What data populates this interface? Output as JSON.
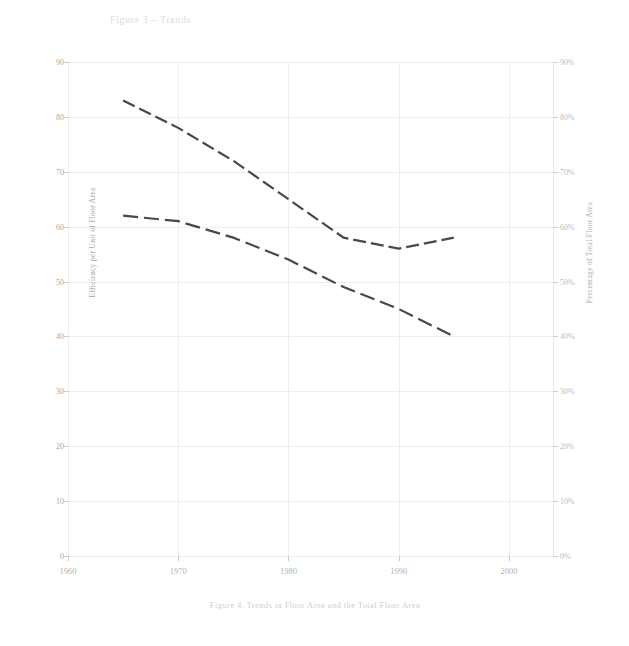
{
  "chart_data": {
    "type": "line",
    "title": "Figure 3 – Trends",
    "xlabel": "",
    "ylabel": "Efficiency per Unit of Floor Area",
    "y2label": "Percentage of Total Floor Area",
    "xlim": [
      1960,
      2004
    ],
    "ylim": [
      0,
      90
    ],
    "y2lim": [
      0,
      90
    ],
    "grid": true,
    "legend": "none",
    "xticks": [
      "1960",
      "1970",
      "1980",
      "1990",
      "2000"
    ],
    "xtick_values": [
      1960,
      1970,
      1980,
      1990,
      2000
    ],
    "yticks": [
      "90",
      "80",
      "70",
      "60",
      "50",
      "40",
      "30",
      "20",
      "10",
      "0"
    ],
    "ytick_values": [
      90,
      80,
      70,
      60,
      50,
      40,
      30,
      20,
      10,
      0
    ],
    "y2ticks": [
      "90%",
      "80%",
      "70%",
      "60%",
      "50%",
      "40%",
      "30%",
      "20%",
      "10%",
      "0%"
    ],
    "y2tick_values": [
      90,
      80,
      70,
      60,
      50,
      40,
      30,
      20,
      10,
      0
    ],
    "series": [
      {
        "name": "Upper series",
        "style": "dashed",
        "color": "#2f2f2f",
        "x": [
          1965,
          1970,
          1975,
          1980,
          1985,
          1990,
          1995
        ],
        "values": [
          83,
          78,
          72,
          65,
          58,
          56,
          58
        ]
      },
      {
        "name": "Lower series",
        "style": "dashed",
        "color": "#2f2f2f",
        "x": [
          1965,
          1970,
          1975,
          1980,
          1985,
          1990,
          1995
        ],
        "values": [
          62,
          61,
          58,
          54,
          49,
          45,
          40
        ]
      }
    ],
    "caption": "Figure 4.  Trends in Floor Area and the Total Floor Area"
  },
  "axes": {
    "left_label": "Efficiency per Unit of Floor Area",
    "right_label": "Percentage of Total Floor Area"
  }
}
